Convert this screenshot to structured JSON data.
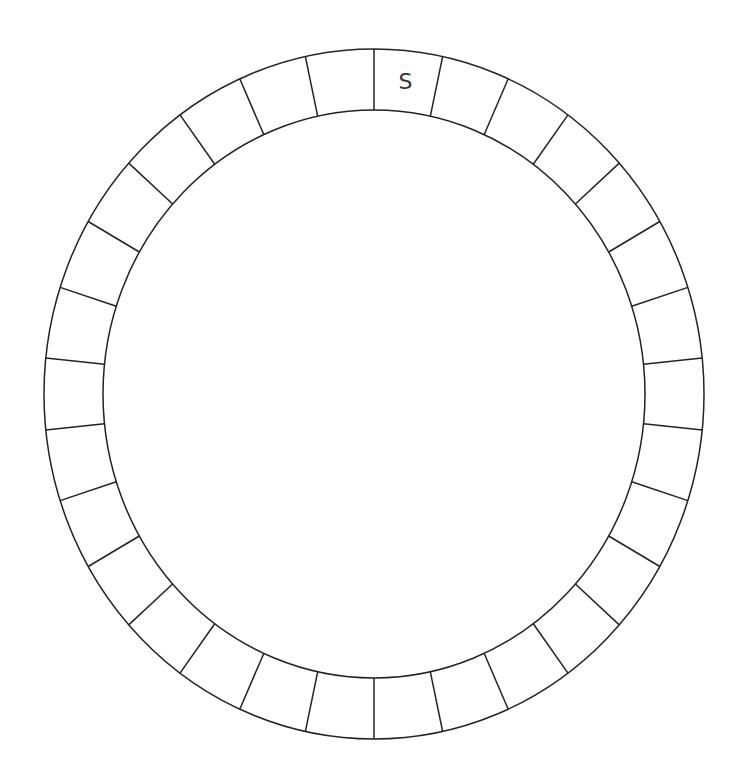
{
  "diagram": {
    "type": "circular-ring-grid",
    "segment_count": 30,
    "start_angle_deg": 0,
    "geometry": {
      "cx": 374,
      "cy": 394,
      "outer_rx": 330,
      "outer_ry": 345,
      "inner_rx": 271,
      "inner_ry": 284
    },
    "colors": {
      "line": "#222222",
      "label": "#333333",
      "background": "#ffffff"
    },
    "cells": [
      {
        "index": 0,
        "label": "S"
      },
      {
        "index": 1,
        "label": ""
      },
      {
        "index": 2,
        "label": ""
      },
      {
        "index": 3,
        "label": ""
      },
      {
        "index": 4,
        "label": ""
      },
      {
        "index": 5,
        "label": ""
      },
      {
        "index": 6,
        "label": ""
      },
      {
        "index": 7,
        "label": ""
      },
      {
        "index": 8,
        "label": ""
      },
      {
        "index": 9,
        "label": ""
      },
      {
        "index": 10,
        "label": ""
      },
      {
        "index": 11,
        "label": ""
      },
      {
        "index": 12,
        "label": ""
      },
      {
        "index": 13,
        "label": ""
      },
      {
        "index": 14,
        "label": ""
      },
      {
        "index": 15,
        "label": ""
      },
      {
        "index": 16,
        "label": ""
      },
      {
        "index": 17,
        "label": ""
      },
      {
        "index": 18,
        "label": ""
      },
      {
        "index": 19,
        "label": ""
      },
      {
        "index": 20,
        "label": ""
      },
      {
        "index": 21,
        "label": ""
      },
      {
        "index": 22,
        "label": ""
      },
      {
        "index": 23,
        "label": ""
      },
      {
        "index": 24,
        "label": ""
      },
      {
        "index": 25,
        "label": ""
      },
      {
        "index": 26,
        "label": ""
      },
      {
        "index": 27,
        "label": ""
      },
      {
        "index": 28,
        "label": ""
      },
      {
        "index": 29,
        "label": ""
      }
    ]
  }
}
